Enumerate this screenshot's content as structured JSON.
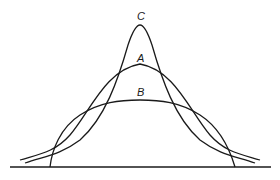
{
  "diagram": {
    "curves": [
      {
        "id": "C",
        "label": "C",
        "shape": "tall, narrow peak (leptokurtic)"
      },
      {
        "id": "A",
        "label": "A",
        "shape": "medium peak (mesokurtic)"
      },
      {
        "id": "B",
        "label": "B",
        "shape": "flat, broad peak (platykurtic)"
      }
    ],
    "colors": {
      "line": "#1a1a1a",
      "background": "#ffffff"
    }
  }
}
